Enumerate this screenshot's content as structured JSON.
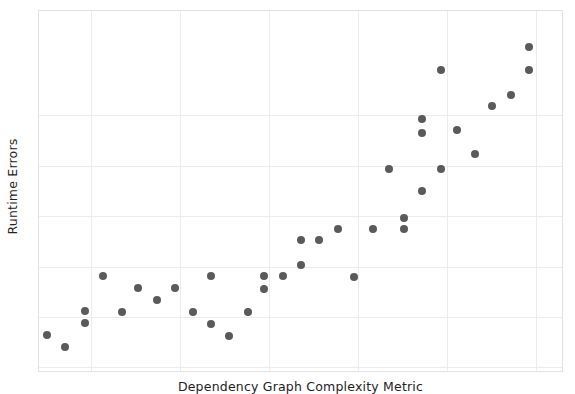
{
  "chart_data": {
    "type": "scatter",
    "title": "",
    "xlabel": "Dependency Graph Complexity Metric",
    "ylabel": "Runtime Errors",
    "xlim": [
      0,
      100
    ],
    "ylim": [
      0,
      100
    ],
    "grid": true,
    "legend": null,
    "marker": {
      "color": "#5a5a5a",
      "size_px": 8,
      "shape": "circle"
    },
    "xticks": [
      10,
      27,
      44,
      61,
      78,
      95
    ],
    "yticks": [
      1,
      15,
      29,
      43,
      57,
      71
    ],
    "points": [
      {
        "x": 1.5,
        "y": 10.0
      },
      {
        "x": 4.9,
        "y": 6.6
      },
      {
        "x": 8.8,
        "y": 16.6
      },
      {
        "x": 8.8,
        "y": 13.3
      },
      {
        "x": 12.2,
        "y": 26.3
      },
      {
        "x": 15.8,
        "y": 16.3
      },
      {
        "x": 19.0,
        "y": 23.1
      },
      {
        "x": 22.5,
        "y": 19.6
      },
      {
        "x": 26.0,
        "y": 23.1
      },
      {
        "x": 29.5,
        "y": 16.3
      },
      {
        "x": 32.9,
        "y": 26.3
      },
      {
        "x": 32.9,
        "y": 13.0
      },
      {
        "x": 36.4,
        "y": 9.7
      },
      {
        "x": 39.9,
        "y": 16.3
      },
      {
        "x": 43.1,
        "y": 26.3
      },
      {
        "x": 43.1,
        "y": 22.8
      },
      {
        "x": 46.6,
        "y": 26.3
      },
      {
        "x": 50.1,
        "y": 29.4
      },
      {
        "x": 50.1,
        "y": 36.4
      },
      {
        "x": 53.6,
        "y": 36.4
      },
      {
        "x": 57.1,
        "y": 39.5
      },
      {
        "x": 60.3,
        "y": 26.1
      },
      {
        "x": 63.8,
        "y": 39.5
      },
      {
        "x": 67.0,
        "y": 56.1
      },
      {
        "x": 69.8,
        "y": 42.5
      },
      {
        "x": 69.8,
        "y": 39.4
      },
      {
        "x": 73.3,
        "y": 70.1
      },
      {
        "x": 73.3,
        "y": 66.2
      },
      {
        "x": 73.3,
        "y": 50.0
      },
      {
        "x": 76.8,
        "y": 83.7
      },
      {
        "x": 76.8,
        "y": 56.0
      },
      {
        "x": 80.0,
        "y": 66.9
      },
      {
        "x": 83.4,
        "y": 60.2
      },
      {
        "x": 86.6,
        "y": 73.7
      },
      {
        "x": 90.2,
        "y": 76.8
      },
      {
        "x": 93.7,
        "y": 90.1
      },
      {
        "x": 93.7,
        "y": 83.5
      }
    ]
  },
  "axes": {
    "y_axis_label": "Runtime Errors",
    "x_axis_label": "Dependency Graph Complexity Metric"
  }
}
